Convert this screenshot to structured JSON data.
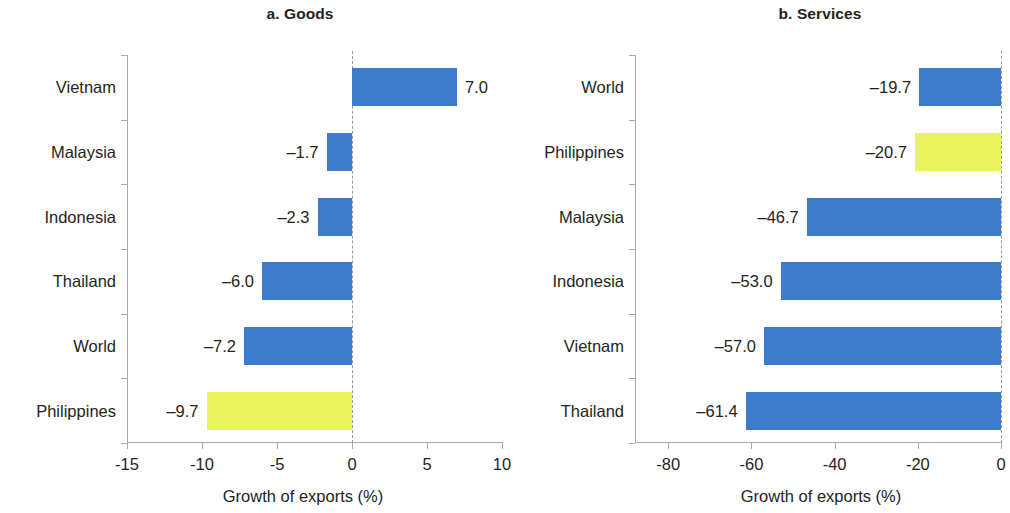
{
  "figure": {
    "background": "#ffffff",
    "series_colors": {
      "default": "#3d7ccb",
      "highlight": "#e9f35e"
    }
  },
  "chart_data": [
    {
      "type": "bar",
      "orientation": "horizontal",
      "panel_id": "a",
      "title": "a. Goods",
      "xlabel": "Growth of exports (%)",
      "ylabel": "",
      "categories": [
        "Vietnam",
        "Malaysia",
        "Indonesia",
        "Thailand",
        "World",
        "Philippines"
      ],
      "values": [
        7.0,
        -1.7,
        -2.3,
        -6.0,
        -7.2,
        -9.7
      ],
      "value_labels": [
        "7.0",
        "–1.7",
        "–2.3",
        "–6.0",
        "–7.2",
        "–9.7"
      ],
      "bar_colors": [
        "#3d7ccb",
        "#3d7ccb",
        "#3d7ccb",
        "#3d7ccb",
        "#3d7ccb",
        "#e9f35e"
      ],
      "xlim": [
        -15,
        10
      ],
      "xticks": [
        -15,
        -10,
        -5,
        0,
        5,
        10
      ],
      "xtick_labels": [
        "-15",
        "-10",
        "-5",
        "0",
        "5",
        "10"
      ],
      "grid": false,
      "zero_reference_line": true,
      "legend": null
    },
    {
      "type": "bar",
      "orientation": "horizontal",
      "panel_id": "b",
      "title": "b. Services",
      "xlabel": "Growth of exports (%)",
      "ylabel": "",
      "categories": [
        "World",
        "Philippines",
        "Malaysia",
        "Indonesia",
        "Vietnam",
        "Thailand"
      ],
      "values": [
        -19.7,
        -20.7,
        -46.7,
        -53.0,
        -57.0,
        -61.4
      ],
      "value_labels": [
        "–19.7",
        "–20.7",
        "–46.7",
        "–53.0",
        "–57.0",
        "–61.4"
      ],
      "bar_colors": [
        "#3d7ccb",
        "#e9f35e",
        "#3d7ccb",
        "#3d7ccb",
        "#3d7ccb",
        "#3d7ccb"
      ],
      "xlim": [
        -88,
        0
      ],
      "xticks": [
        -80,
        -60,
        -40,
        -20,
        0
      ],
      "xtick_labels": [
        "-80",
        "-60",
        "-40",
        "-20",
        "0"
      ],
      "grid": false,
      "zero_reference_line": true,
      "legend": null
    }
  ]
}
